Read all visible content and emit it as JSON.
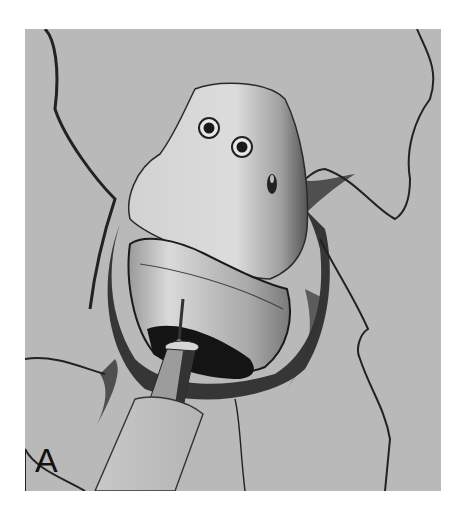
{
  "figure": {
    "panel_label": "A",
    "colors": {
      "background": "#b9b9b9",
      "bone": "#cfcfcf",
      "implant_shell": "#c4c4c4",
      "ink": "#1a1a1a",
      "page": "#ffffff"
    },
    "features": {
      "screw_holes": 2,
      "slot_holes": 1
    }
  }
}
